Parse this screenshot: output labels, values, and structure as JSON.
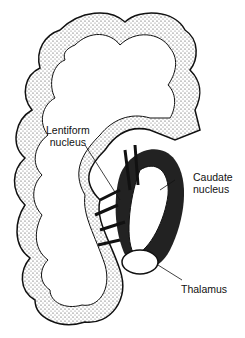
{
  "diagram": {
    "labels": {
      "lentiform": [
        "Lentiform",
        "nucleus"
      ],
      "caudate": [
        "Caudate",
        "nucleus"
      ],
      "thalamus": "Thalamus"
    }
  }
}
